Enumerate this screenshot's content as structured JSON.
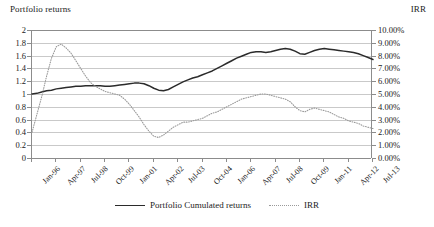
{
  "titles": {
    "left_axis": "Portfolio returns",
    "right_axis": "IRR"
  },
  "legend": [
    {
      "label": "Portfolio Cumulated returns",
      "style": "solid",
      "color": "#2b2b2b"
    },
    {
      "label": "IRR",
      "style": "dotted",
      "color": "#9a9a9a"
    }
  ],
  "chart_data": {
    "type": "line",
    "title": "",
    "xlabel": "",
    "ylabel": "Portfolio returns",
    "y2label": "IRR",
    "grid": true,
    "legend_position": "bottom",
    "ylim": [
      0,
      2
    ],
    "ytick_labels": [
      "2",
      "1.8",
      "1.6",
      "1.4",
      "1.2",
      "1",
      "0.8",
      "0.6",
      "0.4",
      "0.2",
      "0"
    ],
    "ytick_values": [
      2,
      1.8,
      1.6,
      1.4,
      1.2,
      1,
      0.8,
      0.6,
      0.4,
      0.2,
      0
    ],
    "y2lim": [
      0,
      10
    ],
    "y2tick_labels": [
      "10.00%",
      "9.00%",
      "8.00%",
      "7.00%",
      "6.00%",
      "5.00%",
      "4.00%",
      "3.00%",
      "2.00%",
      "1.00%",
      "0.00%"
    ],
    "y2tick_values": [
      10,
      9,
      8,
      7,
      6,
      5,
      4,
      3,
      2,
      1,
      0
    ],
    "xtick_labels": [
      "Jan-96",
      "Apr-97",
      "Jul-98",
      "Oct-99",
      "Jan-01",
      "Apr-02",
      "Jul-03",
      "Oct-04",
      "Jan-06",
      "Apr-07",
      "Jul-08",
      "Oct-09",
      "Jan-11",
      "Apr-12",
      "Jul-13"
    ],
    "x_index_range": [
      0,
      70
    ],
    "xtick_index": [
      0,
      5,
      10,
      15,
      20,
      25,
      30,
      35,
      40,
      45,
      50,
      55,
      60,
      65,
      70
    ],
    "series": [
      {
        "name": "Portfolio Cumulated returns",
        "axis": "left",
        "style": "solid",
        "color": "#2b2b2b",
        "x": [
          0,
          1,
          2,
          3,
          4,
          5,
          6,
          7,
          8,
          9,
          10,
          11,
          12,
          13,
          14,
          15,
          16,
          17,
          18,
          19,
          20,
          21,
          22,
          23,
          24,
          25,
          26,
          27,
          28,
          29,
          30,
          31,
          32,
          33,
          34,
          35,
          36,
          37,
          38,
          39,
          40,
          41,
          42,
          43,
          44,
          45,
          46,
          47,
          48,
          49,
          50,
          51,
          52,
          53,
          54,
          55,
          56,
          57,
          58,
          59,
          60,
          61,
          62,
          63,
          64,
          65,
          66,
          67,
          68,
          69,
          70
        ],
        "values": [
          1.0,
          1.01,
          1.03,
          1.05,
          1.06,
          1.08,
          1.09,
          1.1,
          1.11,
          1.12,
          1.12,
          1.13,
          1.13,
          1.13,
          1.13,
          1.12,
          1.12,
          1.13,
          1.14,
          1.15,
          1.16,
          1.17,
          1.17,
          1.16,
          1.13,
          1.09,
          1.06,
          1.05,
          1.07,
          1.11,
          1.15,
          1.19,
          1.22,
          1.25,
          1.27,
          1.3,
          1.33,
          1.36,
          1.4,
          1.44,
          1.48,
          1.52,
          1.56,
          1.59,
          1.62,
          1.65,
          1.66,
          1.66,
          1.65,
          1.66,
          1.68,
          1.7,
          1.71,
          1.7,
          1.67,
          1.63,
          1.62,
          1.65,
          1.68,
          1.7,
          1.71,
          1.7,
          1.69,
          1.68,
          1.67,
          1.66,
          1.65,
          1.63,
          1.6,
          1.57,
          1.54
        ]
      },
      {
        "name": "IRR",
        "axis": "right",
        "style": "dotted",
        "color": "#9a9a9a",
        "x": [
          0,
          1,
          2,
          3,
          4,
          5,
          6,
          7,
          8,
          9,
          10,
          11,
          12,
          13,
          14,
          15,
          16,
          17,
          18,
          19,
          20,
          21,
          22,
          23,
          24,
          25,
          26,
          27,
          28,
          29,
          30,
          31,
          32,
          33,
          34,
          35,
          36,
          37,
          38,
          39,
          40,
          41,
          42,
          43,
          44,
          45,
          46,
          47,
          48,
          49,
          50,
          51,
          52,
          53,
          54,
          55,
          56,
          57,
          58,
          59,
          60,
          61,
          62,
          63,
          64,
          65,
          66,
          67,
          68,
          69,
          70
        ],
        "values": [
          2.0,
          3.4,
          4.8,
          6.4,
          7.8,
          8.7,
          8.9,
          8.6,
          8.2,
          7.6,
          7.0,
          6.4,
          5.9,
          5.6,
          5.4,
          5.2,
          5.1,
          5.0,
          4.9,
          4.6,
          4.2,
          3.7,
          3.2,
          2.6,
          2.1,
          1.7,
          1.6,
          1.8,
          2.1,
          2.4,
          2.6,
          2.8,
          2.8,
          2.9,
          3.0,
          3.1,
          3.3,
          3.5,
          3.6,
          3.8,
          4.0,
          4.2,
          4.4,
          4.6,
          4.7,
          4.8,
          4.9,
          5.0,
          5.0,
          4.9,
          4.8,
          4.7,
          4.6,
          4.4,
          4.0,
          3.7,
          3.6,
          3.8,
          3.9,
          3.8,
          3.7,
          3.6,
          3.4,
          3.2,
          3.1,
          2.9,
          2.8,
          2.7,
          2.5,
          2.4,
          2.3
        ]
      }
    ]
  }
}
